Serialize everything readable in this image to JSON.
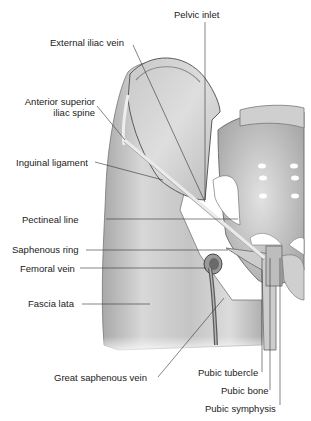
{
  "figure": {
    "colors": {
      "background": "#ffffff",
      "tissue_light": "#e6e6e6",
      "tissue_mid": "#bdbdbd",
      "tissue_dark": "#8a8a8a",
      "outline": "#555555",
      "leader_line": "#333333",
      "label_text": "#222222"
    }
  },
  "labels": {
    "pelvic_inlet": "Pelvic inlet",
    "external_iliac_vein": "External iliac vein",
    "anterior_superior_iliac_spine_1": "Anterior superior",
    "anterior_superior_iliac_spine_2": "iliac spine",
    "inguinal_ligament": "Inguinal ligament",
    "pectineal_line": "Pectineal line",
    "saphenous_ring": "Saphenous ring",
    "femoral_vein": "Femoral vein",
    "fascia_lata": "Fascia lata",
    "great_saphenous_vein": "Great saphenous vein",
    "pubic_tubercle": "Pubic tubercle",
    "pubic_bone": "Pubic bone",
    "pubic_symphysis": "Pubic symphysis"
  }
}
